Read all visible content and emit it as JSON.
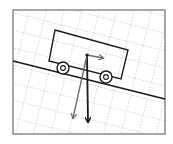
{
  "diagram": {
    "type": "free-body diagram",
    "colors": {
      "background": "#ffffff",
      "frame": "#8a8a8a",
      "grid": "#c8c8c8",
      "incline": "#1a1a1a",
      "cart": "#1a1a1a",
      "gravity_arrow": "#1a1a1a",
      "component_arrows": "#6a6a6a"
    },
    "frame": {
      "x": 13,
      "y": 10,
      "width": 152,
      "height": 124
    },
    "incline": {
      "x1": 13,
      "y1": 61,
      "x2": 165,
      "y2": 99
    },
    "cart": {
      "body": [
        [
          55,
          30
        ],
        [
          128,
          50
        ],
        [
          121,
          79
        ],
        [
          49,
          61
        ]
      ],
      "wheels": [
        {
          "cx": 63,
          "cy": 68,
          "r": 6
        },
        {
          "cx": 106,
          "cy": 77,
          "r": 6
        }
      ]
    },
    "forces": [
      {
        "name": "gravity",
        "from": [
          87,
          55
        ],
        "to": [
          88,
          122
        ],
        "color_key": "gravity_arrow"
      },
      {
        "name": "parallel-component",
        "from": [
          87,
          55
        ],
        "to": [
          103,
          58
        ],
        "color_key": "component_arrows"
      },
      {
        "name": "perpendicular-component",
        "from": [
          87,
          55
        ],
        "to": [
          73,
          118
        ],
        "color_key": "component_arrows"
      }
    ]
  }
}
